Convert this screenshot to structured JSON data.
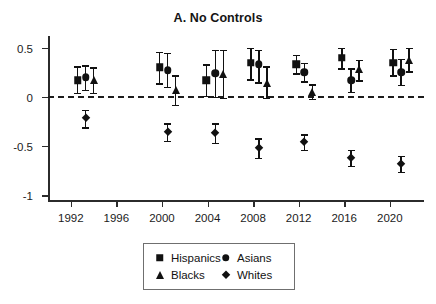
{
  "figure": {
    "title": "A. No Controls",
    "top_cut_text": ""
  },
  "legend": {
    "entries": [
      {
        "label": "Hispanics",
        "marker": "square-marker"
      },
      {
        "label": "Asians",
        "marker": "circle-marker"
      },
      {
        "label": "Blacks",
        "marker": "triangle-marker"
      },
      {
        "label": "Whites",
        "marker": "diamond-marker"
      }
    ]
  },
  "chart_data": {
    "type": "scatter",
    "title": "A. No Controls",
    "xlabel": "",
    "ylabel": "",
    "xlim": [
      1990,
      2023
    ],
    "ylim": [
      -1.05,
      0.62
    ],
    "yticks": [
      0.5,
      0,
      -0.5,
      -1
    ],
    "ytick_labels": [
      "0.5",
      "0",
      "-0.5",
      "-1"
    ],
    "xticks": [
      1992,
      1996,
      2000,
      2004,
      2008,
      2012,
      2016,
      2020
    ],
    "xtick_labels": [
      "1992",
      "1996",
      "2000",
      "2004",
      "2008",
      "2012",
      "2016",
      "2020"
    ],
    "grid": false,
    "reference_line": {
      "y": 0,
      "style": "dashed"
    },
    "legend_position": "below-axes",
    "error_bars": "95% confidence interval",
    "series": [
      {
        "name": "Hispanics",
        "marker": "square",
        "points": [
          {
            "x": 1992.6,
            "y": 0.17,
            "lo": 0.04,
            "hi": 0.31
          },
          {
            "x": 1999.8,
            "y": 0.3,
            "lo": 0.14,
            "hi": 0.46
          },
          {
            "x": 2003.9,
            "y": 0.17,
            "lo": 0.01,
            "hi": 0.33
          },
          {
            "x": 2007.8,
            "y": 0.35,
            "lo": 0.18,
            "hi": 0.5
          },
          {
            "x": 2011.8,
            "y": 0.33,
            "lo": 0.24,
            "hi": 0.43
          },
          {
            "x": 2015.8,
            "y": 0.4,
            "lo": 0.29,
            "hi": 0.5
          },
          {
            "x": 2020.3,
            "y": 0.35,
            "lo": 0.22,
            "hi": 0.49
          }
        ]
      },
      {
        "name": "Asians",
        "marker": "circle",
        "points": [
          {
            "x": 1993.3,
            "y": 0.2,
            "lo": 0.07,
            "hi": 0.32
          },
          {
            "x": 2000.5,
            "y": 0.27,
            "lo": 0.1,
            "hi": 0.45
          },
          {
            "x": 2004.7,
            "y": 0.24,
            "lo": 0.0,
            "hi": 0.48
          },
          {
            "x": 2008.5,
            "y": 0.33,
            "lo": 0.15,
            "hi": 0.48
          },
          {
            "x": 2012.5,
            "y": 0.25,
            "lo": 0.16,
            "hi": 0.35
          },
          {
            "x": 2016.6,
            "y": 0.17,
            "lo": 0.05,
            "hi": 0.29
          },
          {
            "x": 2021.0,
            "y": 0.25,
            "lo": 0.12,
            "hi": 0.39
          }
        ]
      },
      {
        "name": "Blacks",
        "marker": "triangle",
        "points": [
          {
            "x": 1994.0,
            "y": 0.17,
            "lo": 0.04,
            "hi": 0.3
          },
          {
            "x": 2001.2,
            "y": 0.07,
            "lo": -0.08,
            "hi": 0.22
          },
          {
            "x": 2005.4,
            "y": 0.23,
            "lo": -0.01,
            "hi": 0.48
          },
          {
            "x": 2009.2,
            "y": 0.14,
            "lo": -0.01,
            "hi": 0.31
          },
          {
            "x": 2013.2,
            "y": 0.05,
            "lo": -0.02,
            "hi": 0.13
          },
          {
            "x": 2017.3,
            "y": 0.28,
            "lo": 0.17,
            "hi": 0.38
          },
          {
            "x": 2021.7,
            "y": 0.38,
            "lo": 0.26,
            "hi": 0.5
          }
        ]
      },
      {
        "name": "Whites",
        "marker": "diamond",
        "points": [
          {
            "x": 1993.3,
            "y": -0.22,
            "lo": -0.31,
            "hi": -0.13
          },
          {
            "x": 2000.5,
            "y": -0.36,
            "lo": -0.45,
            "hi": -0.27
          },
          {
            "x": 2004.7,
            "y": -0.37,
            "lo": -0.47,
            "hi": -0.27
          },
          {
            "x": 2008.5,
            "y": -0.52,
            "lo": -0.62,
            "hi": -0.42
          },
          {
            "x": 2012.5,
            "y": -0.46,
            "lo": -0.54,
            "hi": -0.38
          },
          {
            "x": 2016.6,
            "y": -0.62,
            "lo": -0.7,
            "hi": -0.54
          },
          {
            "x": 2021.0,
            "y": -0.68,
            "lo": -0.76,
            "hi": -0.6
          }
        ]
      }
    ]
  }
}
